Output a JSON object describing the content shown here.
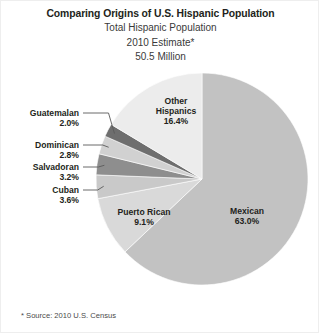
{
  "titles": {
    "main": "Comparing Origins of U.S. Hispanic Population",
    "sub1": "Total Hispanic Population",
    "sub2": "2010 Estimate*",
    "sub3": "50.5 Million"
  },
  "footnote": "* Source: 2010 U.S. Census",
  "labels": {
    "guatemalan": {
      "name": "Guatemalan",
      "pct": "2.0%"
    },
    "dominican": {
      "name": "Dominican",
      "pct": "2.8%"
    },
    "salvadoran": {
      "name": "Salvadoran",
      "pct": "3.2%"
    },
    "cuban": {
      "name": "Cuban",
      "pct": "3.6%"
    },
    "other": {
      "name": "Other",
      "name2": "Hispanics",
      "pct": "16.4%"
    },
    "puertorican": {
      "name": "Puerto Rican",
      "pct": "9.1%"
    },
    "mexican": {
      "name": "Mexican",
      "pct": "63.0%"
    }
  },
  "chart_data": {
    "type": "pie",
    "title": "Comparing Origins of U.S. Hispanic Population",
    "subtitle": "Total Hispanic Population 2010 Estimate* 50.5 Million",
    "total_label": "50.5 Million",
    "units": "percent of total Hispanic population",
    "start_angle_deg": 0,
    "direction": "clockwise",
    "legend": "none (direct labels)",
    "grid": false,
    "categories": [
      "Mexican",
      "Puerto Rican",
      "Cuban",
      "Salvadoran",
      "Dominican",
      "Guatemalan",
      "Other Hispanics"
    ],
    "values": [
      63.0,
      9.1,
      3.6,
      3.2,
      2.8,
      2.0,
      16.4
    ],
    "labels": [
      "63.0%",
      "9.1%",
      "3.6%",
      "3.2%",
      "2.8%",
      "2.0%",
      "16.4%"
    ],
    "colors": [
      "#c2c2c2",
      "#d9d9d9",
      "#c9c9c9",
      "#8e8e8e",
      "#d1d1d1",
      "#6e6e6e",
      "#ececec"
    ],
    "label_placement": [
      "inside",
      "inside",
      "callout-left",
      "callout-left",
      "callout-left",
      "callout-left",
      "inside"
    ],
    "annotations": [
      "* Source: 2010 U.S. Census"
    ],
    "geometry": {
      "cx": 201,
      "cy": 178,
      "r": 106
    }
  },
  "colors": {
    "mexican": "#c2c2c2",
    "puerto_rican": "#d9d9d9",
    "cuban": "#c9c9c9",
    "salvadoran": "#8e8e8e",
    "dominican": "#d1d1d1",
    "guatemalan": "#6e6e6e",
    "other_hispanics": "#ececec",
    "leader_line": "#5a5a5a",
    "text": "#231f20"
  }
}
